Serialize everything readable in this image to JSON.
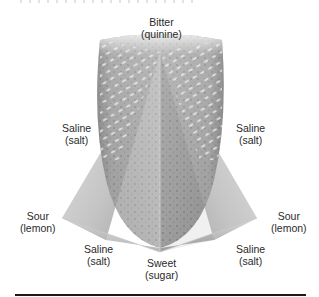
{
  "figure": {
    "labels": {
      "top": {
        "taste": "Bitter",
        "substance": "(quinine)"
      },
      "upper_left": {
        "taste": "Saline",
        "substance": "(salt)"
      },
      "upper_right": {
        "taste": "Saline",
        "substance": "(salt)"
      },
      "left": {
        "taste": "Sour",
        "substance": "(lemon)"
      },
      "right": {
        "taste": "Sour",
        "substance": "(lemon)"
      },
      "lower_left": {
        "taste": "Saline",
        "substance": "(salt)"
      },
      "lower_right": {
        "taste": "Saline",
        "substance": "(salt)"
      },
      "bottom": {
        "taste": "Sweet",
        "substance": "(sugar)"
      }
    },
    "colors": {
      "tongue_dark": "#5a5a5a",
      "tongue_mid": "#8c8c8c",
      "tongue_light": "#d8d8d8",
      "pyramid_light": "#eeeeee",
      "pyramid_mid": "#b5b5b5",
      "rule": "#1a1a1a"
    }
  }
}
